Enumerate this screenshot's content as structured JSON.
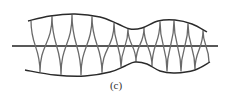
{
  "figure": {
    "caption": "(c)",
    "colors": {
      "axis": "#222222",
      "envelope": "#2a2a2a",
      "wave": "#6a6a6a",
      "background": "#ffffff"
    },
    "axis": {
      "x1": 12,
      "x2": 218,
      "y": 46
    },
    "envelope_upper": [
      [
        28,
        21
      ],
      [
        50,
        16
      ],
      [
        75,
        14
      ],
      [
        100,
        17
      ],
      [
        118,
        24
      ],
      [
        130,
        29
      ],
      [
        142,
        28
      ],
      [
        158,
        21
      ],
      [
        175,
        20
      ],
      [
        192,
        24
      ],
      [
        207,
        32
      ]
    ],
    "envelope_lower": [
      [
        25,
        70
      ],
      [
        55,
        75
      ],
      [
        85,
        76
      ],
      [
        110,
        72
      ],
      [
        125,
        66
      ],
      [
        135,
        62
      ],
      [
        147,
        64
      ],
      [
        160,
        71
      ],
      [
        175,
        73
      ],
      [
        195,
        70
      ],
      [
        210,
        62
      ]
    ],
    "wave_crossings_x": [
      31,
      40,
      52,
      61,
      72,
      81,
      92,
      102,
      114,
      121,
      128,
      136,
      144,
      152,
      160,
      167,
      174,
      181,
      188,
      195,
      203,
      209
    ]
  }
}
